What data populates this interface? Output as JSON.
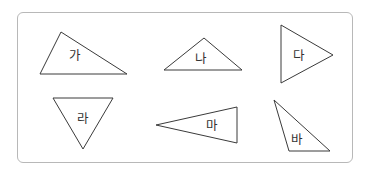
{
  "colors": {
    "border": "#b8b8b8",
    "stroke": "#3a3a3a",
    "text": "#333333"
  },
  "triangles": [
    {
      "id": "ga",
      "label": "가",
      "points": "40,74 61,32 127,74",
      "label_x": 75,
      "label_y": 55
    },
    {
      "id": "na",
      "label": "나",
      "points": "164,70 204,38 242,70",
      "label_x": 201,
      "label_y": 58
    },
    {
      "id": "da",
      "label": "다",
      "points": "281,25 281,83 333,55",
      "label_x": 299,
      "label_y": 55
    },
    {
      "id": "ra",
      "label": "라",
      "points": "53,98 113,98 83,149",
      "label_x": 83,
      "label_y": 118
    },
    {
      "id": "ma",
      "label": "마",
      "points": "156,125 237,107 237,143",
      "label_x": 212,
      "label_y": 125
    },
    {
      "id": "ba",
      "label": "바",
      "points": "274,100 289,151 330,151",
      "label_x": 297,
      "label_y": 139
    }
  ]
}
